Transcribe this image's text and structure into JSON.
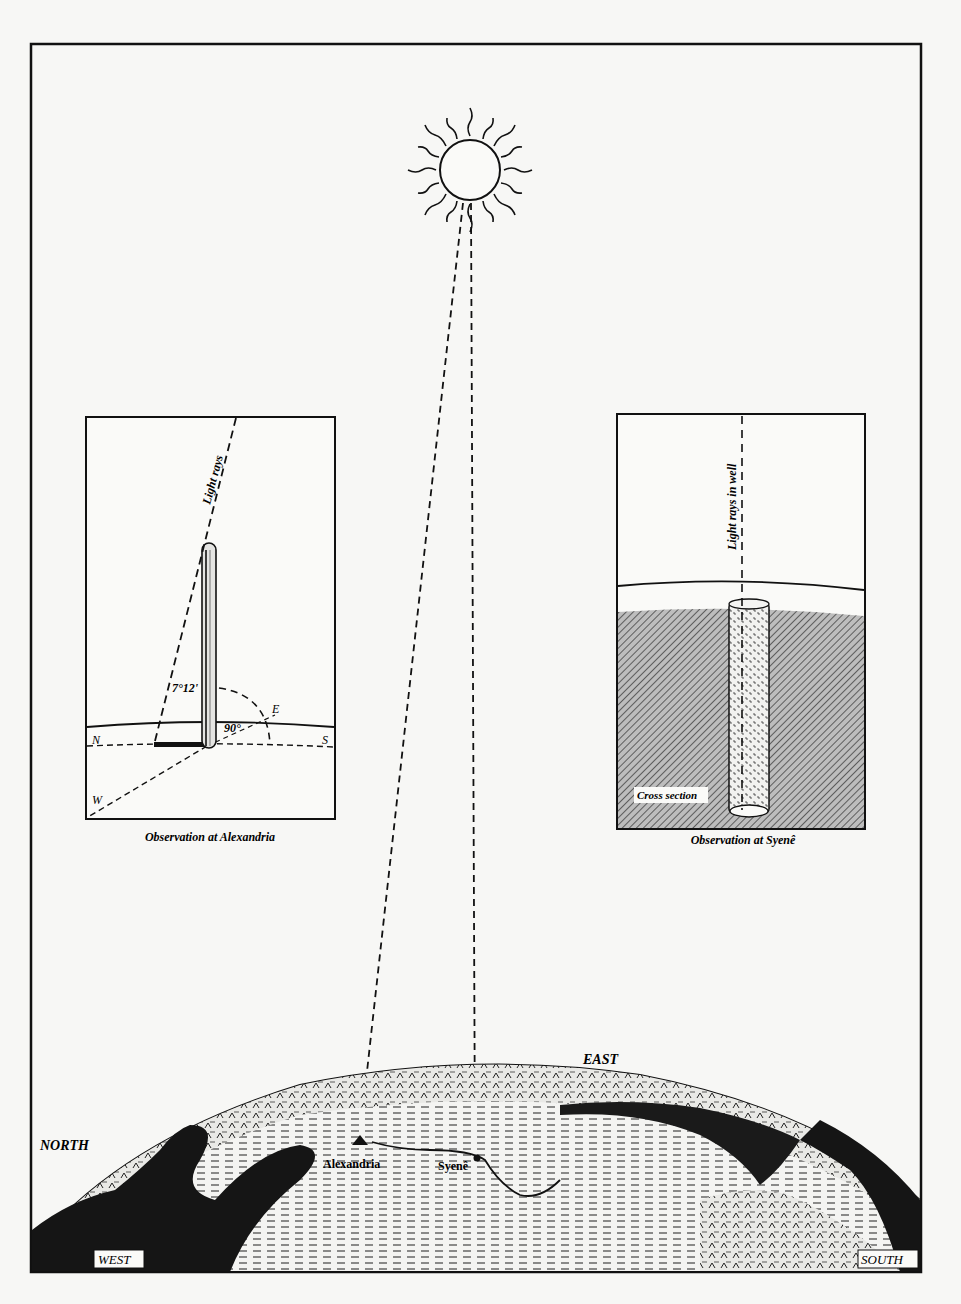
{
  "figure": {
    "colors": {
      "ink": "#111111",
      "paper": "#f7f7f5",
      "hatch": "#555555"
    }
  },
  "sun": {
    "icon": "sun-icon"
  },
  "inset_alexandria": {
    "caption": "Observation at Alexandria",
    "ray_label": "Light rays",
    "angle_label": "7°12'",
    "right_angle_label": "90°",
    "compass": {
      "north": "N",
      "east": "E",
      "south": "S",
      "west": "W"
    }
  },
  "inset_syene": {
    "caption": "Observation at Syenê",
    "ray_label": "Light rays in well",
    "section_label": "Cross section"
  },
  "globe": {
    "labels": {
      "north": "NORTH",
      "east": "EAST",
      "west": "WEST",
      "south": "SOUTH"
    },
    "cities": [
      {
        "name": "Alexandria"
      },
      {
        "name": "Syenê"
      }
    ]
  }
}
